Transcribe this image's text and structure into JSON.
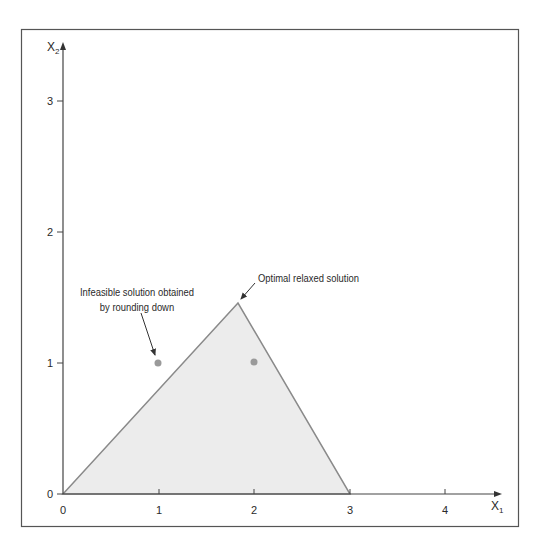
{
  "figure": {
    "x_axis": {
      "label": "X",
      "subscript": "1",
      "ticks": [
        "0",
        "1",
        "2",
        "3",
        "4"
      ],
      "range": [
        0,
        4.5
      ]
    },
    "y_axis": {
      "label": "X",
      "subscript": "2",
      "ticks": [
        "0",
        "1",
        "2",
        "3"
      ],
      "range": [
        0,
        3.3
      ]
    },
    "feasible_region": {
      "vertices": [
        [
          0,
          0
        ],
        [
          1.8,
          1.45
        ],
        [
          3,
          0
        ]
      ],
      "fill": "#ececec",
      "stroke": "#8a8a8a"
    },
    "points": [
      {
        "x": 1,
        "y": 1,
        "color": "#9a9a9a"
      },
      {
        "x": 2,
        "y": 1,
        "color": "#9a9a9a"
      }
    ],
    "annotations": {
      "infeasible_line1": "Infeasible solution obtained",
      "infeasible_line2": "by rounding down",
      "optimal": "Optimal relaxed solution"
    },
    "colors": {
      "frame": "#555555",
      "axis": "#444444",
      "text": "#2a2a2a"
    }
  }
}
